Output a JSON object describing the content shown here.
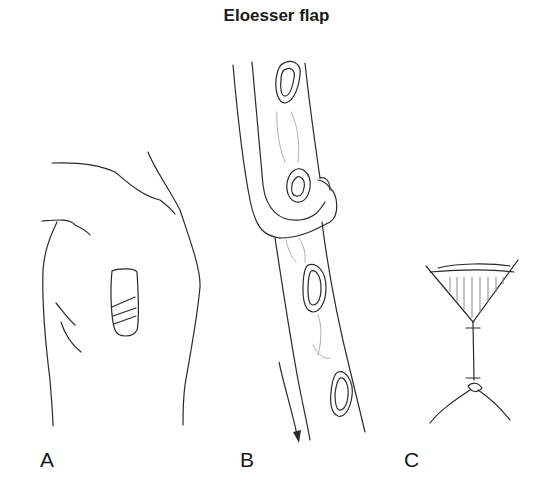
{
  "figure": {
    "title": "Eloesser flap",
    "panels": [
      {
        "id": "A",
        "label": "A",
        "depicts": "posterior chest/shoulder outline with flap window"
      },
      {
        "id": "B",
        "label": "B",
        "depicts": "U-shaped flap across ribs with arrow"
      },
      {
        "id": "C",
        "label": "C",
        "depicts": "funnel-shaped flap with sutured stalk"
      }
    ]
  },
  "colors": {
    "line": "#2a2a2a",
    "faint_line": "#b0b0b0",
    "background": "#ffffff"
  }
}
